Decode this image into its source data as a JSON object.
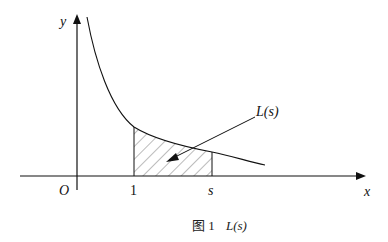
{
  "figure": {
    "axes": {
      "x_label": "x",
      "y_label": "y",
      "origin_label": "O"
    },
    "ticks": {
      "one": "1",
      "s": "s"
    },
    "annotation": "L(s)",
    "caption": {
      "prefix": "图 1",
      "text": "L(s)"
    },
    "colors": {
      "stroke": "#111111",
      "hatch": "#555555",
      "background": "#ffffff"
    }
  }
}
